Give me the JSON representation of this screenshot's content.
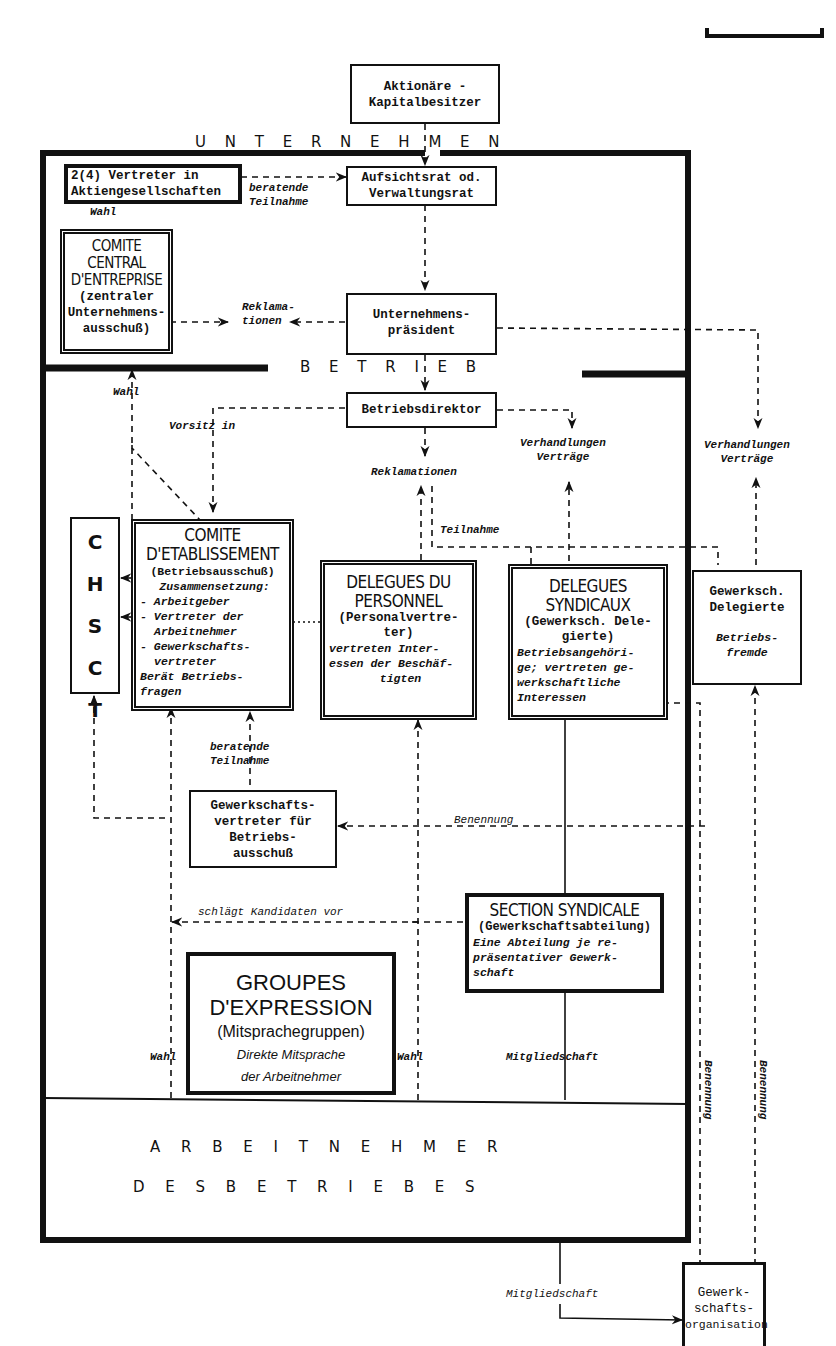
{
  "diagram": {
    "region_labels": {
      "unternehmen": "U  N  T  E  R  N  E  H  M  E  N",
      "betrieb": "B  E  T  R  I  E  B",
      "arbeitnehmer_line1": "A  R  B  E  I  T  N  E  H  M  E  R",
      "arbeitnehmer_line2": "D  E  S     B  E  T  R  I  E  B  E  S"
    },
    "boxes": {
      "aktionaere": {
        "line1": "Aktionäre -",
        "line2": "Kapitalbesitzer"
      },
      "vertreter_ag": {
        "line1": "2(4) Vertreter in",
        "line2": "Aktiengesellschaften"
      },
      "aufsichtsrat": {
        "line1": "Aufsichtsrat od.",
        "line2": "Verwaltungsrat"
      },
      "cce": {
        "title1": "COMITE CENTRAL",
        "title2": "D'ENTREPRISE",
        "sub1": "(zentraler",
        "sub2": "Unternehmens-",
        "sub3": "ausschuß)"
      },
      "praesident": {
        "line1": "Unternehmens-",
        "line2": "präsident"
      },
      "direktor": {
        "line1": "Betriebsdirektor"
      },
      "chsct": {
        "letters": [
          "C",
          "H",
          "S",
          "C",
          "T"
        ]
      },
      "ce": {
        "title1": "COMITE",
        "title2": "D'ETABLISSEMENT",
        "sub": "(Betriebsausschuß)",
        "lines": [
          "Zusammensetzung:",
          "- Arbeitgeber",
          "- Vertreter der",
          "  Arbeitnehmer",
          "- Gewerkschafts-",
          "  vertreter",
          "Berät Betriebs-",
          "fragen"
        ]
      },
      "dp": {
        "title1": "DELEGUES DU",
        "title2": "PERSONNEL",
        "sub1": "(Personalvertre-",
        "sub2": "ter)",
        "lines": [
          "vertreten Inter-",
          "essen der Beschäf-",
          "tigten"
        ]
      },
      "ds": {
        "title1": "DELEGUES",
        "title2": "SYNDICAUX",
        "sub1": "(Gewerksch. Dele-",
        "sub2": "gierte)",
        "lines": [
          "Betriebsangehöri-",
          "ge; vertreten ge-",
          "werkschaftliche",
          "Interessen"
        ]
      },
      "gd": {
        "line1": "Gewerksch.",
        "line2": "Delegierte",
        "it1": "Betriebs-",
        "it2": "fremde"
      },
      "gvb": {
        "line1": "Gewerkschafts-",
        "line2": "vertreter für",
        "line3": "Betriebs-",
        "line4": "ausschuß"
      },
      "ss": {
        "title": "SECTION SYNDICALE",
        "sub": "(Gewerkschaftsabteilung)",
        "lines": [
          "Eine Abteilung je re-",
          "präsentativer Gewerk-",
          "schaft"
        ]
      },
      "ge": {
        "title1": "GROUPES",
        "title2": "D'EXPRESSION",
        "sub": "(Mitsprachegruppen)",
        "it1": "Direkte Mitsprache",
        "it2": "der Arbeitnehmer"
      },
      "go": {
        "line1": "Gewerk-",
        "line2": "schafts-",
        "line3": "organisation"
      }
    },
    "edge_labels": {
      "beratende_teilnahme_top": [
        "beratende",
        "Teilnahme"
      ],
      "wahl_top": "Wahl",
      "reklamationen_top": [
        "Reklama-",
        "tionen"
      ],
      "wahl_left": "Wahl",
      "vorsitz_in": "Vorsitz in",
      "reklamationen_mid": "Reklamationen",
      "verhandlungen_mid": [
        "Verhandlungen",
        "Verträge"
      ],
      "verhandlungen_right": [
        "Verhandlungen",
        "Verträge"
      ],
      "teilnahme": "Teilnahme",
      "beratende_teilnahme_bottom": [
        "beratende",
        "Teilnahme"
      ],
      "benennung_h": "Benennung",
      "schlaegt_vor": "schlägt Kandidaten vor",
      "wahl_ge_left": "Wahl",
      "wahl_ge_right": "Wahl",
      "mitgliedschaft_ss": "Mitgliedschaft",
      "benennung_v1": "Benennung",
      "benennung_v2": "Benennung",
      "mitgliedschaft_go": "Mitgliedschaft"
    }
  }
}
